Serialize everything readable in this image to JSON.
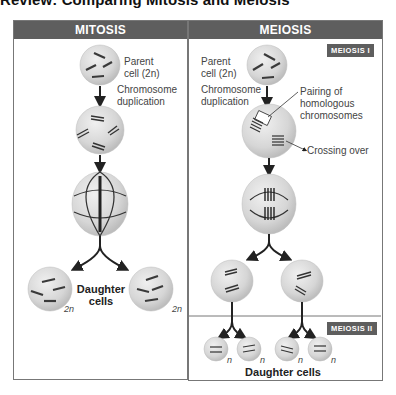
{
  "title": "Review: Comparing Mitosis and Meiosis",
  "mitosis": {
    "header": "MITOSIS",
    "parent_label_line1": "Parent",
    "parent_label_line2": "cell (2n)",
    "duplication_line1": "Chromosome",
    "duplication_line2": "duplication",
    "daughter_line1": "Daughter",
    "daughter_line2": "cells",
    "ploidy_left": "2n",
    "ploidy_right": "2n"
  },
  "meiosis": {
    "header": "MEIOSIS",
    "tag_1": "MEIOSIS I",
    "tag_2": "MEIOSIS II",
    "parent_label_line1": "Parent",
    "parent_label_line2": "cell (2n)",
    "duplication_line1": "Chromosome",
    "duplication_line2": "duplication",
    "pairing_line1": "Pairing of",
    "pairing_line2": "homologous",
    "pairing_line3": "chromosomes",
    "crossing_over": "Crossing over",
    "daughter_cells": "Daughter cells",
    "ploidy": [
      "n",
      "n",
      "n",
      "n"
    ]
  },
  "colors": {
    "header_bg": "#5e5e5e",
    "cell_fill": "#d9d9d9",
    "chromosome": "#3a3a3a",
    "border": "#777777"
  }
}
